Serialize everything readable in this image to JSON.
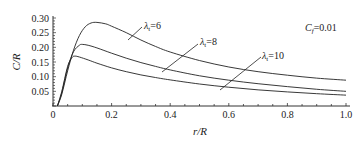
{
  "chart_data": {
    "type": "line",
    "title": "",
    "xlabel": "r/R",
    "ylabel": "C/R",
    "xlim": [
      0,
      1.0
    ],
    "ylim": [
      0,
      0.3
    ],
    "xticks": [
      0,
      0.2,
      0.4,
      0.6,
      0.8,
      1.0
    ],
    "xtick_labels": [
      "0",
      "0.2",
      "0.4",
      "0.6",
      "0.8",
      "1.0"
    ],
    "yticks": [
      0.05,
      0.1,
      0.15,
      0.2,
      0.25,
      0.3
    ],
    "ytick_labels": [
      "0.05",
      "0.10",
      "0.15",
      "0.20",
      "0.25",
      "0.30"
    ],
    "grid": false,
    "legend": "none",
    "annotation": {
      "symbol": "C",
      "subscript": "f",
      "text": "=0.01"
    },
    "series": [
      {
        "name": "λt=6",
        "label_symbol": "λ",
        "label_sub": "t",
        "label_value": "=6",
        "x": [
          0.015,
          0.03,
          0.05,
          0.07,
          0.09,
          0.11,
          0.13,
          0.15,
          0.18,
          0.2,
          0.25,
          0.3,
          0.35,
          0.4,
          0.5,
          0.6,
          0.7,
          0.8,
          0.9,
          1.0
        ],
        "y": [
          0.0,
          0.04,
          0.12,
          0.19,
          0.24,
          0.27,
          0.283,
          0.285,
          0.28,
          0.272,
          0.25,
          0.225,
          0.203,
          0.184,
          0.155,
          0.133,
          0.117,
          0.105,
          0.095,
          0.088
        ]
      },
      {
        "name": "λt=8",
        "label_symbol": "λ",
        "label_sub": "t",
        "label_value": "=8",
        "x": [
          0.015,
          0.03,
          0.05,
          0.07,
          0.09,
          0.1,
          0.12,
          0.15,
          0.2,
          0.25,
          0.3,
          0.35,
          0.4,
          0.5,
          0.6,
          0.7,
          0.8,
          0.9,
          1.0
        ],
        "y": [
          0.0,
          0.045,
          0.13,
          0.185,
          0.207,
          0.21,
          0.207,
          0.198,
          0.18,
          0.163,
          0.148,
          0.135,
          0.123,
          0.103,
          0.088,
          0.076,
          0.066,
          0.057,
          0.05
        ],
        "label_pointer_x": 0.37
      },
      {
        "name": "λt=10",
        "label_symbol": "λ",
        "label_sub": "t",
        "label_value": "=10",
        "x": [
          0.015,
          0.03,
          0.05,
          0.065,
          0.075,
          0.09,
          0.12,
          0.15,
          0.2,
          0.25,
          0.3,
          0.35,
          0.4,
          0.5,
          0.6,
          0.7,
          0.8,
          0.9,
          1.0
        ],
        "y": [
          0.0,
          0.05,
          0.135,
          0.165,
          0.17,
          0.167,
          0.157,
          0.146,
          0.13,
          0.117,
          0.106,
          0.097,
          0.089,
          0.075,
          0.064,
          0.055,
          0.048,
          0.042,
          0.037
        ]
      }
    ]
  }
}
